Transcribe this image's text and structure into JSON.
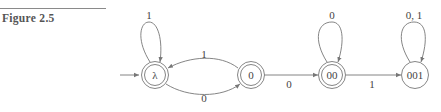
{
  "figure": {
    "rule": true,
    "label": "Figure 2.5"
  },
  "diagram": {
    "type": "finite-automaton",
    "start_state": "λ",
    "states": [
      {
        "id": "lambda",
        "label": "λ",
        "accepting": true
      },
      {
        "id": "s0",
        "label": "0",
        "accepting": true
      },
      {
        "id": "s00",
        "label": "00",
        "accepting": true
      },
      {
        "id": "s001",
        "label": "001",
        "accepting": false
      }
    ],
    "transitions": [
      {
        "from": "lambda",
        "to": "lambda",
        "label": "1"
      },
      {
        "from": "s0",
        "to": "lambda",
        "label": "1"
      },
      {
        "from": "lambda",
        "to": "s0",
        "label": "0"
      },
      {
        "from": "s0",
        "to": "s00",
        "label": "0"
      },
      {
        "from": "s00",
        "to": "s00",
        "label": "0"
      },
      {
        "from": "s00",
        "to": "s001",
        "label": "1"
      },
      {
        "from": "s001",
        "to": "s001",
        "label": "0, 1"
      }
    ]
  }
}
